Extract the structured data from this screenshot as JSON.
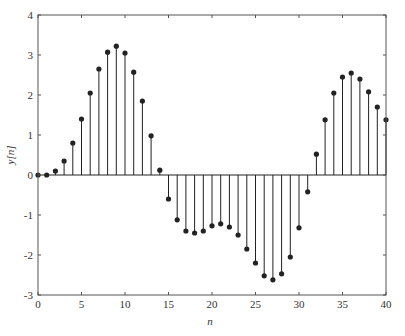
{
  "chart_data": {
    "type": "stem",
    "title": "",
    "xlabel": "n",
    "ylabel": "y[n]",
    "xlim": [
      0,
      40
    ],
    "ylim": [
      -3,
      4
    ],
    "xticks": [
      0,
      5,
      10,
      15,
      20,
      25,
      30,
      35,
      40
    ],
    "yticks": [
      -3,
      -2,
      -1,
      0,
      1,
      2,
      3,
      4
    ],
    "grid": false,
    "x": [
      0,
      1,
      2,
      3,
      4,
      5,
      6,
      7,
      8,
      9,
      10,
      11,
      12,
      13,
      14,
      15,
      16,
      17,
      18,
      19,
      20,
      21,
      22,
      23,
      24,
      25,
      26,
      27,
      28,
      29,
      30,
      31,
      32,
      33,
      34,
      35,
      36,
      37,
      38,
      39,
      40
    ],
    "values": [
      0,
      0.0,
      0.1,
      0.35,
      0.8,
      1.4,
      2.05,
      2.65,
      3.07,
      3.22,
      3.05,
      2.57,
      1.85,
      0.98,
      0.12,
      -0.6,
      -1.12,
      -1.4,
      -1.45,
      -1.4,
      -1.27,
      -1.22,
      -1.3,
      -1.5,
      -1.85,
      -2.2,
      -2.52,
      -2.62,
      -2.47,
      -2.05,
      -1.32,
      -0.42,
      0.52,
      1.38,
      2.05,
      2.45,
      2.55,
      2.4,
      2.08,
      1.7,
      1.38
    ]
  },
  "colors": {
    "stem": "#222222",
    "axis": "#555555"
  }
}
